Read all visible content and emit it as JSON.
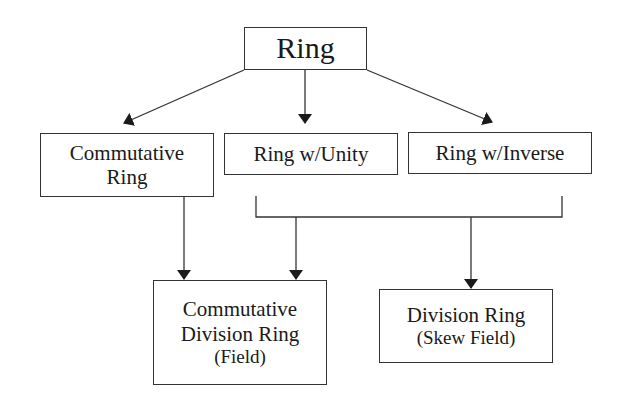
{
  "diagram": {
    "nodes": {
      "ring": {
        "lines": [
          "Ring"
        ]
      },
      "commutative_ring": {
        "lines": [
          "Commutative",
          "Ring"
        ]
      },
      "ring_unity": {
        "lines": [
          "Ring w/Unity"
        ]
      },
      "ring_inverse": {
        "lines": [
          "Ring w/Inverse"
        ]
      },
      "field": {
        "lines": [
          "Commutative",
          "Division Ring",
          "(Field)"
        ]
      },
      "division_ring": {
        "lines": [
          "Division Ring",
          "(Skew Field)"
        ]
      }
    },
    "edges": [
      {
        "from": "Ring",
        "to": "Commutative Ring"
      },
      {
        "from": "Ring",
        "to": "Ring w/Unity"
      },
      {
        "from": "Ring",
        "to": "Ring w/Inverse"
      },
      {
        "from": "Commutative Ring",
        "to": "Commutative Division Ring (Field)"
      },
      {
        "from": "Ring w/Unity + Ring w/Inverse",
        "to": "Commutative Division Ring (Field)"
      },
      {
        "from": "Ring w/Unity + Ring w/Inverse",
        "to": "Division Ring (Skew Field)"
      }
    ]
  }
}
